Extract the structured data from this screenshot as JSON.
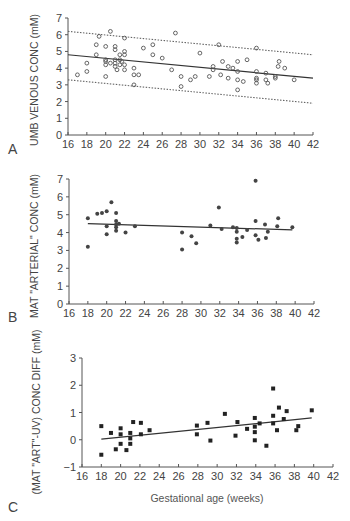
{
  "chart_data": [
    {
      "panel": "A",
      "type": "scatter",
      "title": "",
      "xlabel": "",
      "ylabel": "UMB VENOUS CONC (mM)",
      "xlim": [
        16,
        42
      ],
      "ylim": [
        0,
        7
      ],
      "xticks": [
        16,
        18,
        20,
        22,
        24,
        26,
        28,
        30,
        32,
        34,
        36,
        38,
        40,
        42
      ],
      "yticks": [
        0,
        1,
        2,
        3,
        4,
        5,
        6,
        7
      ],
      "grid": false,
      "marker": "open-circle",
      "regression_line": {
        "x": [
          16,
          42
        ],
        "y": [
          4.8,
          3.4
        ]
      },
      "prediction_bands": [
        {
          "style": "dotted",
          "x": [
            16,
            42
          ],
          "y": [
            6.2,
            4.8
          ]
        },
        {
          "style": "dotted",
          "x": [
            16,
            42
          ],
          "y": [
            3.3,
            1.9
          ]
        }
      ],
      "points": [
        [
          17,
          3.6
        ],
        [
          18,
          4.3
        ],
        [
          18,
          3.8
        ],
        [
          19,
          5.4
        ],
        [
          19,
          4.8
        ],
        [
          19.3,
          5.9
        ],
        [
          20,
          5.3
        ],
        [
          20,
          4.5
        ],
        [
          20,
          4.4
        ],
        [
          20,
          4.2
        ],
        [
          20,
          3.5
        ],
        [
          20.5,
          6.2
        ],
        [
          20.5,
          4.3
        ],
        [
          21,
          5.3
        ],
        [
          21,
          5.1
        ],
        [
          21,
          4.5
        ],
        [
          21,
          4.3
        ],
        [
          21,
          4.1
        ],
        [
          21.2,
          3.9
        ],
        [
          21.5,
          4.8
        ],
        [
          21.5,
          4.5
        ],
        [
          21.5,
          4.2
        ],
        [
          21.7,
          4.4
        ],
        [
          22,
          5.8
        ],
        [
          22,
          5.0
        ],
        [
          22,
          4.8
        ],
        [
          22,
          4.2
        ],
        [
          22,
          3.9
        ],
        [
          23,
          4.0
        ],
        [
          23,
          3.6
        ],
        [
          23,
          3.0
        ],
        [
          23.5,
          3.6
        ],
        [
          24,
          5.2
        ],
        [
          25,
          5.4
        ],
        [
          25,
          4.8
        ],
        [
          26,
          4.6
        ],
        [
          27,
          3.9
        ],
        [
          27.4,
          6.1
        ],
        [
          28,
          3.5
        ],
        [
          28,
          2.9
        ],
        [
          29,
          3.3
        ],
        [
          29.5,
          3.5
        ],
        [
          30,
          4.9
        ],
        [
          31,
          3.5
        ],
        [
          31.4,
          4.1
        ],
        [
          31.4,
          3.9
        ],
        [
          32,
          5.4
        ],
        [
          32.2,
          3.6
        ],
        [
          32.4,
          4.4
        ],
        [
          33,
          4.1
        ],
        [
          33,
          3.4
        ],
        [
          33.5,
          4.0
        ],
        [
          34,
          4.4
        ],
        [
          34,
          3.8
        ],
        [
          34,
          3.3
        ],
        [
          34,
          2.7
        ],
        [
          34.6,
          3.2
        ],
        [
          35,
          4.5
        ],
        [
          36,
          5.2
        ],
        [
          36,
          3.8
        ],
        [
          36,
          3.4
        ],
        [
          36,
          3.3
        ],
        [
          36,
          3.1
        ],
        [
          37,
          3.7
        ],
        [
          37,
          3.3
        ],
        [
          37.2,
          3.1
        ],
        [
          38,
          3.5
        ],
        [
          38,
          3.4
        ],
        [
          38.3,
          4.1
        ],
        [
          38.4,
          4.4
        ],
        [
          39,
          4.0
        ],
        [
          40,
          3.3
        ]
      ]
    },
    {
      "panel": "B",
      "type": "scatter",
      "title": "",
      "xlabel": "",
      "ylabel": "MAT \"ARTERIAL\" CONC (mM)",
      "xlim": [
        16,
        42
      ],
      "ylim": [
        0,
        7
      ],
      "xticks": [
        16,
        18,
        20,
        22,
        24,
        26,
        28,
        30,
        32,
        34,
        36,
        38,
        40,
        42
      ],
      "yticks": [
        0,
        1,
        2,
        3,
        4,
        5,
        6,
        7
      ],
      "grid": false,
      "marker": "filled-circle",
      "regression_line": {
        "x": [
          18,
          39.7
        ],
        "y": [
          4.5,
          4.15
        ]
      },
      "points": [
        [
          18,
          4.8
        ],
        [
          18,
          3.2
        ],
        [
          19,
          5.05
        ],
        [
          19.5,
          5.1
        ],
        [
          20,
          5.2
        ],
        [
          20,
          4.35
        ],
        [
          20,
          3.9
        ],
        [
          20.5,
          5.7
        ],
        [
          21,
          5.1
        ],
        [
          21,
          4.65
        ],
        [
          21,
          4.45
        ],
        [
          21,
          4.3
        ],
        [
          21,
          4.1
        ],
        [
          21.3,
          4.5
        ],
        [
          22,
          4.0
        ],
        [
          23,
          4.35
        ],
        [
          28,
          4.0
        ],
        [
          28,
          3.05
        ],
        [
          29,
          3.8
        ],
        [
          29.5,
          3.4
        ],
        [
          31,
          4.4
        ],
        [
          31.9,
          5.4
        ],
        [
          32.2,
          4.2
        ],
        [
          33.4,
          4.3
        ],
        [
          33.8,
          4.25
        ],
        [
          33.8,
          4.05
        ],
        [
          33.8,
          3.65
        ],
        [
          33.8,
          3.45
        ],
        [
          34.4,
          3.75
        ],
        [
          34.9,
          4.15
        ],
        [
          35.8,
          6.9
        ],
        [
          35.8,
          4.65
        ],
        [
          35.8,
          3.85
        ],
        [
          36.1,
          3.6
        ],
        [
          36.8,
          4.45
        ],
        [
          36.9,
          3.7
        ],
        [
          37.1,
          4.05
        ],
        [
          38.1,
          4.35
        ],
        [
          38.2,
          4.8
        ],
        [
          39.7,
          4.3
        ]
      ]
    },
    {
      "panel": "C",
      "type": "scatter",
      "title": "",
      "xlabel": "Gestational age (weeks)",
      "ylabel": "(MAT \"ART\"-UV) CONC DIFF (mM)",
      "xlim": [
        16,
        42
      ],
      "ylim": [
        -1,
        3
      ],
      "xticks": [
        16,
        18,
        20,
        22,
        24,
        26,
        28,
        30,
        32,
        34,
        36,
        38,
        40,
        42
      ],
      "yticks": [
        -1,
        0,
        1,
        2,
        3
      ],
      "grid": false,
      "marker": "filled-square",
      "regression_line": {
        "x": [
          18,
          39.8
        ],
        "y": [
          0.02,
          0.8
        ]
      },
      "points": [
        [
          18,
          0.5
        ],
        [
          18,
          -0.55
        ],
        [
          19,
          0.25
        ],
        [
          19.5,
          -0.35
        ],
        [
          20,
          0.42
        ],
        [
          20,
          0.2
        ],
        [
          20,
          -0.15
        ],
        [
          20.6,
          -0.38
        ],
        [
          21,
          0.25
        ],
        [
          21,
          0.05
        ],
        [
          21,
          -0.15
        ],
        [
          21.3,
          0.65
        ],
        [
          22.1,
          0.62
        ],
        [
          22.1,
          0.2
        ],
        [
          23,
          0.35
        ],
        [
          27.9,
          0.52
        ],
        [
          27.9,
          0.2
        ],
        [
          29,
          0.62
        ],
        [
          29.3,
          -0.03
        ],
        [
          30.8,
          0.95
        ],
        [
          31.9,
          0.15
        ],
        [
          32.1,
          0.65
        ],
        [
          33.1,
          0.4
        ],
        [
          33.9,
          0.8
        ],
        [
          33.9,
          0.48
        ],
        [
          33.9,
          0.28
        ],
        [
          33.9,
          -0.02
        ],
        [
          34.4,
          0.6
        ],
        [
          35.1,
          -0.22
        ],
        [
          35.8,
          1.88
        ],
        [
          35.8,
          0.88
        ],
        [
          35.8,
          0.6
        ],
        [
          36.2,
          0.35
        ],
        [
          36.4,
          1.18
        ],
        [
          36.9,
          0.76
        ],
        [
          37.2,
          1.05
        ],
        [
          38.2,
          0.35
        ],
        [
          38.4,
          0.5
        ],
        [
          39.8,
          1.08
        ]
      ]
    }
  ],
  "panels": [
    {
      "letter": "A",
      "ylabel": "UMB VENOUS CONC (mM)"
    },
    {
      "letter": "B",
      "ylabel": "MAT \"ARTERIAL\" CONC (mM)"
    },
    {
      "letter": "C",
      "ylabel": "(MAT \"ART\"-UV) CONC DIFF (mM)",
      "xlabel": "Gestational age (weeks)"
    }
  ]
}
